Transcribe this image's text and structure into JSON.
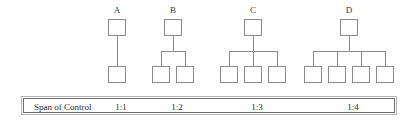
{
  "figure": {
    "type": "span-of-control-diagram",
    "background_color": "#ffffff",
    "line_color": "#8a8a8a",
    "box_fill": "#ffffff",
    "text_color": "#2b2b2b"
  },
  "trees": [
    {
      "label": "A",
      "children_count": 1,
      "ratio": "1:1",
      "left": 97,
      "width": 40,
      "root_center": 117,
      "child_centers": [
        117
      ]
    },
    {
      "label": "B",
      "children_count": 2,
      "ratio": "1:2",
      "left": 145,
      "width": 56,
      "root_center": 173,
      "child_centers": [
        161,
        185
      ]
    },
    {
      "label": "C",
      "children_count": 3,
      "ratio": "1:3",
      "left": 213,
      "width": 80,
      "root_center": 253,
      "child_centers": [
        229,
        253,
        277
      ]
    },
    {
      "label": "D",
      "children_count": 4,
      "ratio": "1:4",
      "left": 297,
      "width": 104,
      "root_center": 349,
      "child_centers": [
        313,
        337,
        361,
        385
      ]
    }
  ],
  "span_bar": {
    "title": "Span of Control",
    "ratios": [
      {
        "value": "1:1",
        "center": 117
      },
      {
        "value": "1:2",
        "center": 173
      },
      {
        "value": "1:3",
        "center": 253
      },
      {
        "value": "1:4",
        "center": 349
      }
    ],
    "border_color": "#6e6e6e"
  }
}
